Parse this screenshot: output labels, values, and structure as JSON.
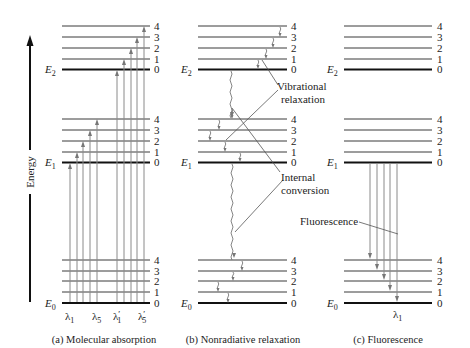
{
  "figure": {
    "axis_label": "Energy",
    "panels": [
      {
        "id": "a",
        "caption": "(a) Molecular absorption",
        "electronic_states": [
          "E0",
          "E1",
          "E2"
        ],
        "wavelength_labels": [
          "λ1",
          "λ5",
          "λ'1",
          "λ'5"
        ]
      },
      {
        "id": "b",
        "caption": "(b) Nonradiative relaxation",
        "electronic_states": [
          "E0",
          "E1",
          "E2"
        ],
        "annotations": [
          "Vibrational relaxation",
          "Internal conversion"
        ]
      },
      {
        "id": "c",
        "caption": "(c) Fluorescence",
        "electronic_states": [
          "E0",
          "E1",
          "E2"
        ],
        "annotations": [
          "Fluorescence"
        ],
        "wavelength_labels": [
          "λ1"
        ]
      }
    ],
    "vibrational_levels": [
      "0",
      "1",
      "2",
      "3",
      "4"
    ],
    "labels": {
      "E2": "E",
      "E2_sub": "2",
      "E1": "E",
      "E1_sub": "1",
      "E0": "E",
      "E0_sub": "0",
      "vib_relax_1": "Vibrational",
      "vib_relax_2": "relaxation",
      "int_conv_1": "Internal",
      "int_conv_2": "conversion",
      "fluorescence": "Fluorescence",
      "lambda": "λ",
      "sub1": "1",
      "sub5": "5",
      "prime": "′"
    },
    "colors": {
      "ground_line": "#111111",
      "level_line": "#3a3a3a",
      "arrow": "#8a8a8a"
    }
  }
}
